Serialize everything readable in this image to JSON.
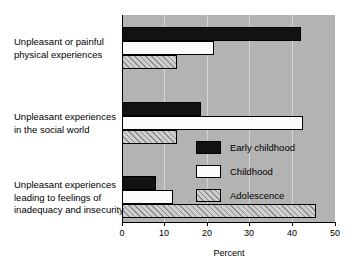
{
  "chart_data": {
    "type": "bar",
    "orientation": "horizontal",
    "title": "",
    "xlabel": "Percent",
    "ylabel": "",
    "xlim": [
      0,
      50
    ],
    "xticks": [
      0,
      10,
      20,
      30,
      40,
      50
    ],
    "xtick_labels": [
      "0",
      "10",
      "20",
      "30",
      "40",
      "50"
    ],
    "grid": true,
    "grid_axis": "x",
    "legend_position": "inside-right-middle",
    "plot_background": "#b3b3b3",
    "categories": [
      "Unpleasant or painful physical experiences",
      "Unpleasant experiences in the social world",
      "Unpleasant experiences leading to feelings of inadequacy and insecurity"
    ],
    "category_lines": [
      [
        "Unpleasant or painful",
        "physical experiences"
      ],
      [
        "Unpleasant experiences",
        "in the social world"
      ],
      [
        "Unpleasant experiences",
        "leading to feelings of",
        "inadequacy and insecurity"
      ]
    ],
    "series": [
      {
        "name": "Early childhood",
        "color": "#121212",
        "pattern": "solid-black",
        "values": [
          42.0,
          18.5,
          8.0
        ]
      },
      {
        "name": "Childhood",
        "color": "#fbfbfb",
        "pattern": "solid-white",
        "values": [
          21.5,
          42.5,
          12.0
        ]
      },
      {
        "name": "Adolescence",
        "color": "#cfcfcf",
        "pattern": "diagonal-hatch",
        "values": [
          13.0,
          13.0,
          45.5
        ]
      }
    ]
  },
  "axis": {
    "x_title": "Percent"
  },
  "legend": {
    "entries": [
      {
        "label": "Early childhood",
        "swatch": "solid-black"
      },
      {
        "label": "Childhood",
        "swatch": "solid-white"
      },
      {
        "label": "Adolescence",
        "swatch": "diagonal-hatch"
      }
    ]
  }
}
